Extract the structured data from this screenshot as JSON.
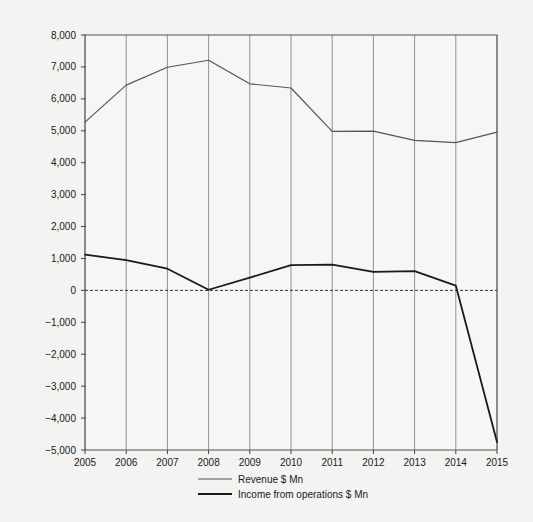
{
  "chart_data": {
    "type": "line",
    "title": "",
    "xlabel": "",
    "ylabel": "",
    "categories": [
      "2005",
      "2006",
      "2007",
      "2008",
      "2009",
      "2010",
      "2011",
      "2012",
      "2013",
      "2014",
      "2015"
    ],
    "x": [
      2005,
      2006,
      2007,
      2008,
      2009,
      2010,
      2011,
      2012,
      2013,
      2014,
      2015
    ],
    "series": [
      {
        "name": "Revenue $ Mn",
        "color": "#555555",
        "values": [
          5270,
          6430,
          6990,
          7210,
          6470,
          6340,
          4980,
          4990,
          4700,
          4630,
          4960
        ]
      },
      {
        "name": "Income from operations $ Mn",
        "color": "#1a1a1a",
        "values": [
          1120,
          950,
          680,
          20,
          400,
          790,
          810,
          580,
          605,
          150,
          -4750
        ]
      }
    ],
    "ylim": [
      -5000,
      8000
    ],
    "yticks": [
      -5000,
      -4000,
      -3000,
      -2000,
      -1000,
      0,
      1000,
      2000,
      3000,
      4000,
      5000,
      6000,
      7000,
      8000
    ],
    "ytick_labels": [
      "−5,000",
      "−4,000",
      "−3,000",
      "−2,000",
      "−1,000",
      "0",
      "1,000",
      "2,000",
      "3,000",
      "4,000",
      "5,000",
      "6,000",
      "7,000",
      "8,000"
    ],
    "xticks": [
      2005,
      2006,
      2007,
      2008,
      2009,
      2010,
      2011,
      2012,
      2013,
      2014,
      2015
    ],
    "xtick_labels": [
      "2005",
      "2006",
      "2007",
      "2008",
      "2009",
      "2010",
      "2011",
      "2012",
      "2013",
      "2014",
      "2015"
    ],
    "grid": "vertical",
    "zero_line": true,
    "legend_position": "bottom",
    "legend": [
      {
        "label": "Revenue $ Mn",
        "color": "#555555"
      },
      {
        "label": "Income from operations $ Mn",
        "color": "#1a1a1a"
      }
    ]
  },
  "colors": {
    "background": "#f3f3f1",
    "plot_background": "#f6f6f4",
    "axis": "#555555",
    "grid": "#777777",
    "revenue": "#555555",
    "income": "#1a1a1a"
  }
}
